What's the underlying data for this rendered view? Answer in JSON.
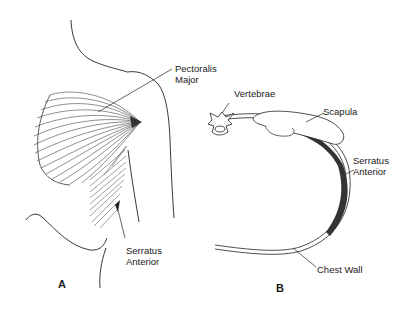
{
  "figure": {
    "panel_a": {
      "panel_label": "A",
      "labels": {
        "pectoralis_line1": "Pectoralis",
        "pectoralis_line2": "Major",
        "serratus_line1": "Serratus",
        "serratus_line2": "Anterior"
      }
    },
    "panel_b": {
      "panel_label": "B",
      "labels": {
        "vertebrae": "Vertebrae",
        "scapula": "Scapula",
        "serratus_line1": "Serratus",
        "serratus_line2": "Anterior",
        "chest_wall": "Chest Wall"
      }
    }
  }
}
